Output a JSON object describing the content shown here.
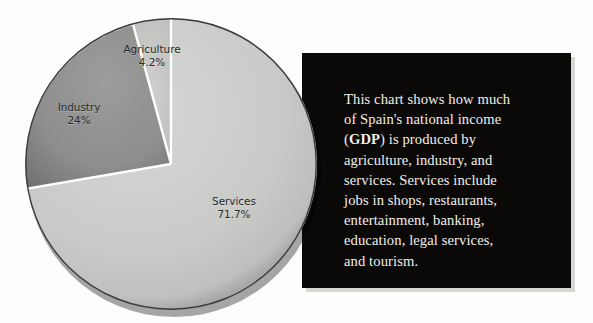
{
  "chart_data": {
    "type": "pie",
    "title": "",
    "categories": [
      "Agriculture",
      "Industry",
      "Services"
    ],
    "values": [
      4.2,
      24,
      71.7
    ],
    "value_labels": [
      "4.2%",
      "24%",
      "71.7%"
    ],
    "unit": "%",
    "legend": "none",
    "slice_colors": [
      "#c6c6c6",
      "#8f8f8f",
      "#c9c9c9"
    ],
    "divider_color": "#ffffff",
    "start_angle_deg": 90,
    "direction": "counterclockwise",
    "slices": [
      {
        "name": "Agriculture",
        "value": 4.2,
        "label": "Agriculture",
        "value_label": "4.2%",
        "color": "#c6c6c6"
      },
      {
        "name": "Industry",
        "value": 24,
        "label": "Industry",
        "value_label": "24%",
        "color": "#8f8f8f"
      },
      {
        "name": "Services",
        "value": 71.7,
        "label": "Services",
        "value_label": "71.7%",
        "color": "#c9c9c9"
      }
    ]
  },
  "pie": {
    "agriculture": {
      "name": "Agriculture",
      "percent": "4.2%"
    },
    "industry": {
      "name": "Industry",
      "percent": "24%"
    },
    "services": {
      "name": "Services",
      "percent": "71.7%"
    }
  },
  "info": {
    "background_color": "#0a0908",
    "text_color": "#f2efe9",
    "lines": [
      "This chart shows how much",
      "of Spain's national income",
      "(GDP) is produced by",
      "agriculture, industry, and",
      "services. Services include",
      "jobs in shops, restaurants,",
      "entertainment, banking,",
      "education, legal services,",
      "and tourism."
    ],
    "emphasis_term": "GDP",
    "paragraph_before": "This chart shows how much of Spain's national income (",
    "paragraph_after": ") is produced by agriculture, industry, and services. Services include jobs in shops, restaurants, entertainment, banking, education, legal services, and tourism."
  }
}
